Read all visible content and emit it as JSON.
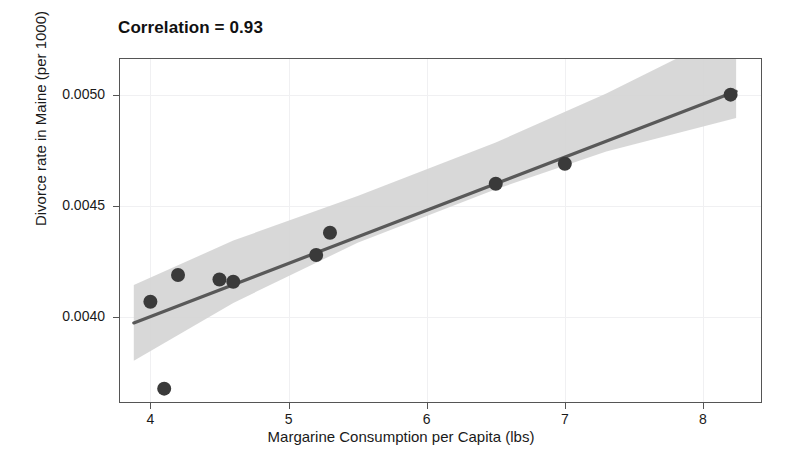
{
  "chart_data": {
    "type": "scatter",
    "title": "Correlation = 0.93",
    "xlabel": "Margarine Consumption per Capita (lbs)",
    "ylabel": "Divorce rate in Maine (per 1000)",
    "xlim": [
      3.78,
      8.42
    ],
    "ylim": [
      0.00362,
      0.00516
    ],
    "xticks": [
      4,
      5,
      6,
      7,
      8
    ],
    "xtick_labels": [
      "4",
      "5",
      "6",
      "7",
      "8"
    ],
    "yticks": [
      0.004,
      0.0045,
      0.005
    ],
    "ytick_labels": [
      "0.0040",
      "0.0045",
      "0.0050"
    ],
    "grid": true,
    "legend": "none",
    "points": [
      {
        "x": 4.0,
        "y": 0.00407
      },
      {
        "x": 4.1,
        "y": 0.00368
      },
      {
        "x": 4.2,
        "y": 0.00419
      },
      {
        "x": 4.5,
        "y": 0.00417
      },
      {
        "x": 4.6,
        "y": 0.00416
      },
      {
        "x": 5.2,
        "y": 0.00428
      },
      {
        "x": 5.3,
        "y": 0.00438
      },
      {
        "x": 6.5,
        "y": 0.0046
      },
      {
        "x": 7.0,
        "y": 0.00469
      },
      {
        "x": 8.2,
        "y": 0.005
      }
    ],
    "point_color": "#3a3a3a",
    "point_size": 7,
    "fit_line": {
      "type": "linear",
      "color": "#595959",
      "x_start": 3.88,
      "x_end": 8.24,
      "y_start": 0.003975,
      "y_end": 0.005015
    },
    "confidence_band": {
      "color": "#d4d4d4",
      "opacity": 0.85,
      "upper": [
        {
          "x": 3.88,
          "y": 0.004145
        },
        {
          "x": 4.6,
          "y": 0.004345
        },
        {
          "x": 5.5,
          "y": 0.004545
        },
        {
          "x": 6.5,
          "y": 0.004785
        },
        {
          "x": 7.3,
          "y": 0.005005
        },
        {
          "x": 8.24,
          "y": 0.005295
        }
      ],
      "lower": [
        {
          "x": 3.88,
          "y": 0.003805
        },
        {
          "x": 4.6,
          "y": 0.004065
        },
        {
          "x": 5.5,
          "y": 0.004335
        },
        {
          "x": 6.5,
          "y": 0.004575
        },
        {
          "x": 7.3,
          "y": 0.004745
        },
        {
          "x": 8.24,
          "y": 0.004895
        }
      ]
    }
  }
}
